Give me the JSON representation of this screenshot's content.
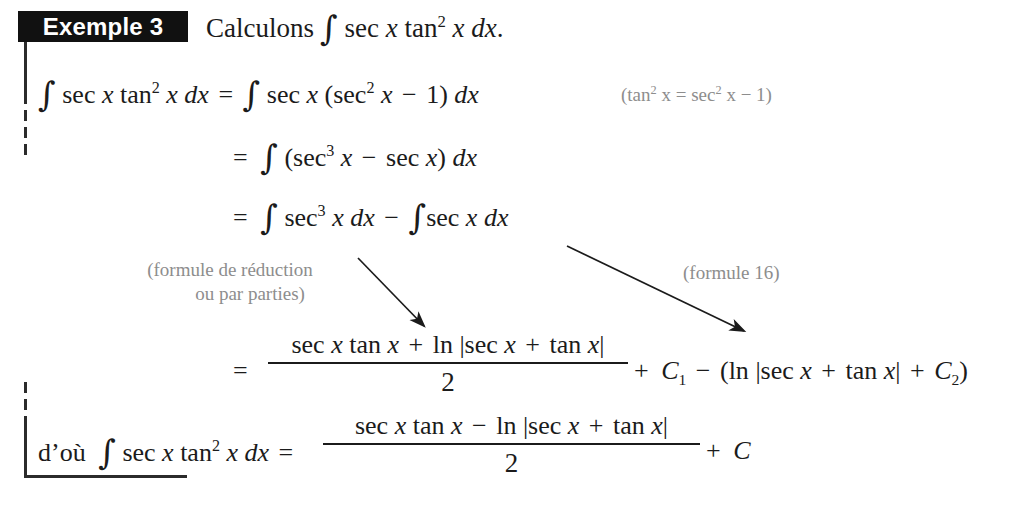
{
  "document": {
    "language": "fr",
    "example_label": "Exemple 3",
    "prompt": "Calculons",
    "prompt_integral": "∫ sec x tan² x dx."
  },
  "colors": {
    "ink": "#1b1b1b",
    "tag_background": "#111111",
    "tag_text": "#ffffff",
    "annotation_grey": "#8d8d8d",
    "rule": "#2b2b2b",
    "page_background": "#ffffff"
  },
  "heading": {
    "tag": "Exemple 3",
    "text_before_integral": "Calculons",
    "integrand": "sec x tan² x dx.",
    "full": "Calculons ∫ sec x tan² x dx."
  },
  "steps": [
    {
      "id": "line-1",
      "lhs": "∫ sec x tan² x dx",
      "relation": "=",
      "rhs": "∫ sec x (sec² x − 1) dx",
      "note": "(tan² x = sec² x − 1)"
    },
    {
      "id": "line-2",
      "lhs": "",
      "relation": "=",
      "rhs": "∫ (sec³ x − sec x) dx",
      "note": ""
    },
    {
      "id": "line-3",
      "lhs": "",
      "relation": "=",
      "rhs": "∫ sec³ x dx − ∫ sec x dx",
      "note": ""
    },
    {
      "id": "line-4",
      "lhs": "",
      "relation": "=",
      "rhs": "(sec x tan x + ln |sec x + tan x|)/2 + C₁ − (ln |sec x + tan x| + C₂)",
      "note": ""
    }
  ],
  "line1": {
    "integral_sign": "∫",
    "sec": "sec",
    "x": "x",
    "tan": "tan",
    "exp2": "2",
    "dx": "dx",
    "equals": "=",
    "open_paren": "(",
    "close_paren": ")",
    "minus": "−",
    "one": "1"
  },
  "line1_note": {
    "text": "(tan² x = sec² x − 1)",
    "open": "(tan",
    "exp": "2",
    "var": " x = sec",
    "exp2": "2",
    "tail": " x − 1)"
  },
  "line2": {
    "equals": "=",
    "integral_sign": "∫",
    "open_paren": "(",
    "sec": "sec",
    "exp3": "3",
    "x": "x",
    "minus": "−",
    "close_paren": ")",
    "dx": "dx"
  },
  "line3": {
    "equals": "=",
    "integral_sign": "∫",
    "sec": "sec",
    "exp3": "3",
    "x": "x",
    "dx": "dx",
    "minus": "−"
  },
  "annotations": {
    "left": {
      "line1": "(formule de réduction",
      "line2": "ou par parties)"
    },
    "right": {
      "line1": "(formule 16)"
    }
  },
  "arrows": [
    {
      "name": "arrow-reduction-formula",
      "from": [
        358,
        258
      ],
      "to": [
        428,
        330
      ]
    },
    {
      "name": "arrow-formula-16",
      "from": [
        567,
        246
      ],
      "to": [
        748,
        334
      ]
    }
  ],
  "line4": {
    "equals": "=",
    "numerator": "sec x tan x + ln |sec x + tan x|",
    "denominator": "2",
    "tail": "+ C₁ − (ln |sec x + tan x| + C₂)",
    "num_parts": {
      "sec": "sec",
      "x": "x",
      "tan": "tan",
      "plus": "+",
      "ln": "ln",
      "bar": "|"
    },
    "plus": "+",
    "C": "C",
    "sub1": "1",
    "minus": "−",
    "open_paren": "(",
    "ln": "ln",
    "close_paren": ")",
    "sub2": "2"
  },
  "final_line": {
    "prefix": "d’où",
    "integral_sign": "∫",
    "lhs": "∫ sec x tan² x dx",
    "equals": "=",
    "numerator": "sec x tan x − ln |sec x + tan x|",
    "denominator": "2",
    "tail": "+ C",
    "plus": "+",
    "C": "C",
    "sec": "sec",
    "tan": "tan",
    "x": "x",
    "dx": "dx",
    "exp2": "2",
    "ln": "ln",
    "bar": "|",
    "minus": "−"
  }
}
